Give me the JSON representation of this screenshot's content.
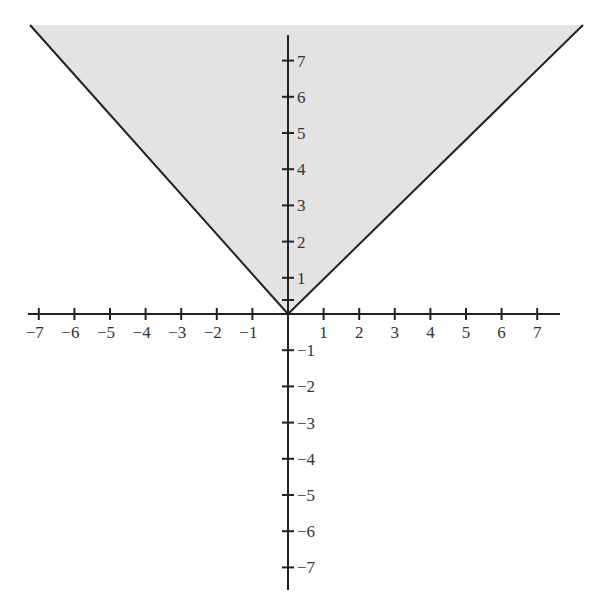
{
  "chart_data": {
    "type": "area",
    "title": "",
    "function": "y = |x|",
    "shaded_region": "y >= |x|",
    "fill_color": "#e3e3e3",
    "line_color": "#222222",
    "boundary_points": [
      [
        -7.2,
        7.8
      ],
      [
        0,
        0
      ],
      [
        8.3,
        8.1
      ]
    ],
    "x": [
      -7,
      -6,
      -5,
      -4,
      -3,
      -2,
      -1,
      0,
      1,
      2,
      3,
      4,
      5,
      6,
      7
    ],
    "y": [
      7,
      6,
      5,
      4,
      3,
      2,
      1,
      0,
      1,
      2,
      3,
      4,
      5,
      6,
      7
    ],
    "xlabel": "",
    "ylabel": "",
    "xlim": [
      -7.5,
      8
    ],
    "ylim": [
      -7.5,
      8
    ],
    "grid": false,
    "legend": null,
    "x_tick_labels": [
      "−7",
      "−6",
      "−5",
      "−4",
      "−3",
      "−2",
      "−1",
      "1",
      "2",
      "3",
      "4",
      "5",
      "6",
      "7"
    ],
    "y_tick_labels_positive": [
      "7",
      "6",
      "5",
      "4",
      "3",
      "2",
      "1"
    ],
    "y_tick_labels_negative": [
      "−1",
      "−2",
      "−3",
      "−4",
      "−5",
      "−6",
      "−7"
    ]
  }
}
